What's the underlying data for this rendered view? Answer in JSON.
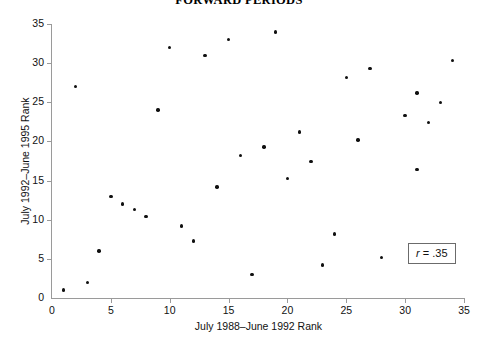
{
  "chart_data": {
    "type": "scatter",
    "title": "FORWARD PERIODS",
    "xlabel": "July 1988–June 1992 Rank",
    "ylabel": "July 1992–June 1995 Rank",
    "xlim": [
      0,
      35
    ],
    "ylim": [
      0,
      35
    ],
    "xticks": [
      0,
      5,
      10,
      15,
      20,
      25,
      30,
      35
    ],
    "yticks": [
      0,
      5,
      10,
      15,
      20,
      25,
      30,
      35
    ],
    "grid": false,
    "legend": null,
    "annotations": [
      {
        "name": "correlation-box",
        "prefix": "r",
        "separator": " = ",
        "value": ".35",
        "text": "r = .35"
      }
    ],
    "points": [
      {
        "x": 1,
        "y": 1
      },
      {
        "x": 2,
        "y": 27
      },
      {
        "x": 3,
        "y": 2
      },
      {
        "x": 4,
        "y": 6
      },
      {
        "x": 5,
        "y": 13
      },
      {
        "x": 6,
        "y": 12
      },
      {
        "x": 7,
        "y": 11.3
      },
      {
        "x": 8,
        "y": 10.4
      },
      {
        "x": 9,
        "y": 24
      },
      {
        "x": 10,
        "y": 32
      },
      {
        "x": 11,
        "y": 9.2
      },
      {
        "x": 12,
        "y": 7.3
      },
      {
        "x": 13,
        "y": 31
      },
      {
        "x": 14,
        "y": 14.2
      },
      {
        "x": 15,
        "y": 33
      },
      {
        "x": 16,
        "y": 18.2
      },
      {
        "x": 17,
        "y": 3
      },
      {
        "x": 18,
        "y": 19.3
      },
      {
        "x": 19,
        "y": 34
      },
      {
        "x": 20,
        "y": 15.3
      },
      {
        "x": 21,
        "y": 21.2
      },
      {
        "x": 22,
        "y": 17.4
      },
      {
        "x": 23,
        "y": 4.2
      },
      {
        "x": 24,
        "y": 8.2
      },
      {
        "x": 25,
        "y": 28.2
      },
      {
        "x": 26,
        "y": 20.2
      },
      {
        "x": 27,
        "y": 29.3
      },
      {
        "x": 28,
        "y": 5.2
      },
      {
        "x": 30,
        "y": 23.3
      },
      {
        "x": 31,
        "y": 26.2
      },
      {
        "x": 31,
        "y": 16.4
      },
      {
        "x": 32,
        "y": 22.4
      },
      {
        "x": 33,
        "y": 25
      },
      {
        "x": 34,
        "y": 30.3
      }
    ]
  },
  "colors": {
    "point": "#101010",
    "axis": "#9a9a9a",
    "box_border": "#6b6b6b",
    "background": "#ffffff",
    "text": "#111111"
  }
}
